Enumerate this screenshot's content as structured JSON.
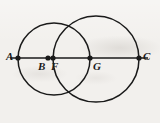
{
  "figure": {
    "kind": "geometry-diagram",
    "background_color": "#f2f0ed",
    "stroke_color": "#1a1a1a",
    "canvas": {
      "width": 160,
      "height": 123
    },
    "line": {
      "name": "segment-AC",
      "x1": 10,
      "y1": 58,
      "x2": 148,
      "y2": 58,
      "stroke_width": 1.6
    },
    "circles": [
      {
        "name": "left-circle",
        "cx": 54,
        "cy": 59,
        "r": 36,
        "stroke_width": 1.5
      },
      {
        "name": "right-circle",
        "cx": 96,
        "cy": 59,
        "r": 43,
        "stroke_width": 1.5
      }
    ],
    "points": [
      {
        "id": "A",
        "label": "A",
        "x": 18,
        "y": 58,
        "label_x": 6,
        "label_y": 51,
        "dot_r": 2.6
      },
      {
        "id": "B",
        "label": "B",
        "x": 48,
        "y": 58,
        "label_x": 38,
        "label_y": 61,
        "dot_r": 2.6
      },
      {
        "id": "F",
        "label": "F",
        "x": 53,
        "y": 58,
        "label_x": 51,
        "label_y": 61,
        "dot_r": 2.6
      },
      {
        "id": "G",
        "label": "G",
        "x": 90,
        "y": 58,
        "label_x": 93,
        "label_y": 61,
        "dot_r": 2.6
      },
      {
        "id": "C",
        "label": "C",
        "x": 139,
        "y": 58,
        "label_x": 143,
        "label_y": 51,
        "dot_r": 2.6
      }
    ]
  }
}
